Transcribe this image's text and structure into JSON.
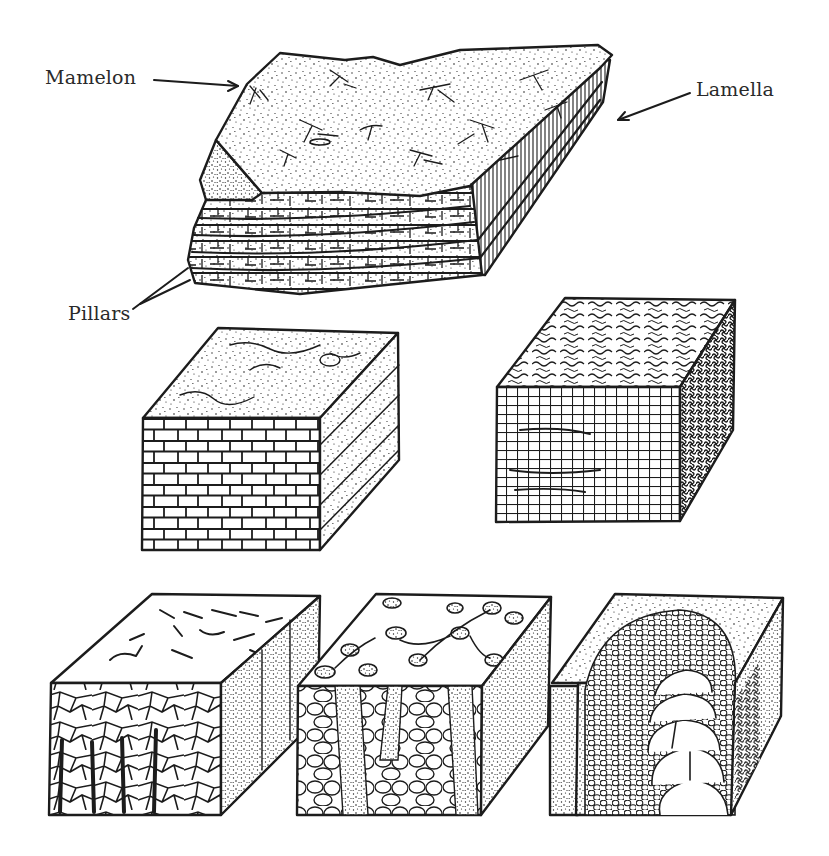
{
  "figure": {
    "type": "scientific-line-illustration",
    "background": "#ffffff",
    "ink_color": "#1c1c1c",
    "label_color": "#2a2a2a",
    "labels": {
      "mamelon": "Mamelon",
      "lamella": "Lamella",
      "pillars": "Pillars"
    },
    "blocks": [
      {
        "id": "top-slab",
        "description": "Large stippled slab with branching surface mamelons, layered lamellae on sides, pillars at corner"
      },
      {
        "id": "middle-left",
        "description": "Cube with brick-like polygonal cracked front, stippled banded side"
      },
      {
        "id": "middle-right",
        "description": "Cube with fine cross-hatched grid front, wavy worm-like top, dark reticulated side"
      },
      {
        "id": "bottom-left",
        "description": "Cube with irregular polygon front and vertical dark columns, stippled side"
      },
      {
        "id": "bottom-middle",
        "description": "Cube with rounded cobble cells and stippled vertical bands, circular nodules on top"
      },
      {
        "id": "bottom-right",
        "description": "Cube with arched concentric cell columns, stippled faces"
      }
    ]
  }
}
